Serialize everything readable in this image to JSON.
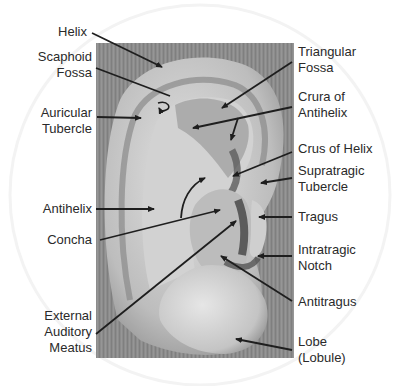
{
  "diagram": {
    "labels_left": [
      {
        "id": "helix",
        "text": "Helix"
      },
      {
        "id": "scaphoid-fossa",
        "text": "Scaphoid\nFossa"
      },
      {
        "id": "auricular-tubercle",
        "text": "Auricular\nTubercle"
      },
      {
        "id": "antihelix",
        "text": "Antihelix"
      },
      {
        "id": "concha",
        "text": "Concha"
      },
      {
        "id": "external-auditory-meatus",
        "text": "External\nAuditory\nMeatus"
      }
    ],
    "labels_right": [
      {
        "id": "triangular-fossa",
        "text": "Triangular\nFossa"
      },
      {
        "id": "crura-of-antihelix",
        "text": "Crura of\nAntihelix"
      },
      {
        "id": "crus-of-helix",
        "text": "Crus of Helix"
      },
      {
        "id": "supratragic-tubercle",
        "text": "Supratragic\nTubercle"
      },
      {
        "id": "tragus",
        "text": "Tragus"
      },
      {
        "id": "intratragic-notch",
        "text": "Intratragic\nNotch"
      },
      {
        "id": "antitragus",
        "text": "Antitragus"
      },
      {
        "id": "lobe",
        "text": "Lobe\n(Lobule)"
      }
    ],
    "colors": {
      "background": "#ffffff",
      "image_bg": "#8a8a8a",
      "ear_light": "#d8d8d8",
      "ear_mid": "#b4b4b4",
      "ear_dark": "#6e6e6e",
      "leader_line": "#1e1e1e",
      "label_text": "#2a2a2a"
    }
  }
}
